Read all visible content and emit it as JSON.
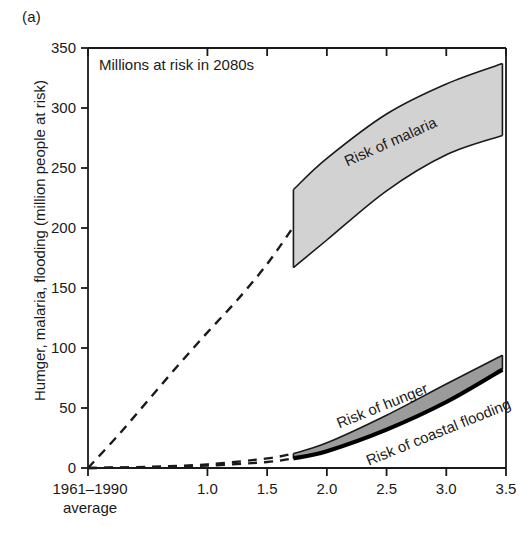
{
  "figure": {
    "panel_label": "(a)",
    "annotation": "Millions at risk in 2080s",
    "y_axis_title": "Humger, malaria, flooding (million people at risk)"
  },
  "chart_data": {
    "type": "line",
    "title": "Millions at risk in 2080s",
    "xlabel": "",
    "ylabel": "Humger, malaria, flooding (million people at risk)",
    "xlim": [
      0,
      3.5
    ],
    "ylim": [
      0,
      350
    ],
    "grid": false,
    "legend": "inline-labels",
    "x_tick_labels": [
      "1961–1990\naverage",
      "1.0",
      "1.5",
      "2.0",
      "2.5",
      "3.0",
      "3.5"
    ],
    "x_tick_values": [
      0,
      1.0,
      1.5,
      2.0,
      2.5,
      3.0,
      3.5
    ],
    "x_first_tick_line1": "1961–1990",
    "x_first_tick_line2": "average",
    "y_tick_labels": [
      "0",
      "50",
      "100",
      "150",
      "200",
      "250",
      "300",
      "350"
    ],
    "y_tick_values": [
      0,
      50,
      100,
      150,
      200,
      250,
      300,
      350
    ],
    "series": [
      {
        "name": "Risk of malaria (projection, dashed)",
        "style": "dashed",
        "x": [
          0,
          0.25,
          0.5,
          0.75,
          1.0,
          1.25,
          1.5,
          1.72
        ],
        "values": [
          0,
          27,
          56,
          85,
          113,
          140,
          170,
          201
        ]
      },
      {
        "name": "Risk of malaria (range band)",
        "style": "band",
        "color": "#d2d2d2",
        "x": [
          1.72,
          2.0,
          2.5,
          3.0,
          3.47
        ],
        "upper": [
          232,
          258,
          295,
          320,
          337
        ],
        "lower": [
          167,
          190,
          231,
          261,
          277
        ]
      },
      {
        "name": "Risk of hunger (projection, dashed upper)",
        "style": "dashed",
        "x": [
          0,
          0.5,
          1.0,
          1.5,
          1.72
        ],
        "values": [
          0,
          1,
          3,
          8,
          12
        ]
      },
      {
        "name": "Risk of coastal flooding (projection, dashed lower)",
        "style": "dashed",
        "x": [
          0,
          0.5,
          1.0,
          1.5,
          1.72
        ],
        "values": [
          0,
          0.5,
          2,
          5,
          8
        ]
      },
      {
        "name": "Risk of hunger (range band)",
        "style": "band",
        "color": "#9b9b9b",
        "x": [
          1.72,
          2.0,
          2.5,
          3.0,
          3.47
        ],
        "upper": [
          12,
          21,
          44,
          70,
          94
        ],
        "lower": [
          8,
          14,
          32,
          55,
          82
        ]
      },
      {
        "name": "Risk of coastal flooding",
        "style": "solid-thick",
        "color": "#000000",
        "x": [
          1.72,
          2.0,
          2.5,
          3.0,
          3.47
        ],
        "values": [
          8,
          14,
          32,
          55,
          82
        ]
      }
    ],
    "inline_labels": [
      {
        "text": "Risk of malaria",
        "x": 2.55,
        "y": 268
      },
      {
        "text": "Risk of hunger",
        "x": 2.48,
        "y": 48
      },
      {
        "text": "Risk of coastal flooding",
        "x": 2.95,
        "y": 26
      }
    ],
    "colors": {
      "malaria_band": "#d2d2d2",
      "hunger_band": "#9b9b9b",
      "flooding_line": "#000000",
      "axis": "#1a1a1a"
    }
  }
}
